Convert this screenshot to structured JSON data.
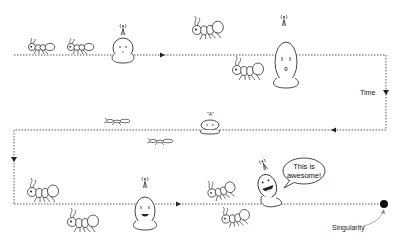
{
  "diagram": {
    "title": "",
    "labels": {
      "time": "Time",
      "singularity": "Singularity",
      "speech_line1": "This is",
      "speech_line2": "awesome!"
    },
    "colors": {
      "line": "#333333",
      "fill": "#ffffff",
      "dot": "#111111"
    },
    "rows": [
      {
        "name": "row-1",
        "direction": "right",
        "y": 55
      },
      {
        "name": "row-2",
        "direction": "left",
        "y": 130
      },
      {
        "name": "row-3",
        "direction": "right",
        "y": 204
      }
    ],
    "figures": [
      {
        "type": "ant",
        "row": 1,
        "x": 40,
        "y": 48
      },
      {
        "type": "ant",
        "row": 1,
        "x": 80,
        "y": 48
      },
      {
        "type": "robot-blob",
        "row": 1,
        "x": 124,
        "y": 50,
        "expression": "neutral"
      },
      {
        "type": "ant-upright",
        "row": 1,
        "x": 205,
        "y": 28
      },
      {
        "type": "ant-upright",
        "row": 1,
        "x": 245,
        "y": 70
      },
      {
        "type": "robot-tall",
        "row": 1,
        "x": 286,
        "y": 62,
        "expression": "surprised"
      },
      {
        "type": "ant-flat",
        "row": 2,
        "x": 126,
        "y": 121
      },
      {
        "type": "robot-flat",
        "row": 2,
        "x": 210,
        "y": 128
      },
      {
        "type": "ant-flat",
        "row": 2,
        "x": 168,
        "y": 141
      },
      {
        "type": "ant-upright",
        "row": 3,
        "x": 40,
        "y": 192
      },
      {
        "type": "ant-upright",
        "row": 3,
        "x": 80,
        "y": 222
      },
      {
        "type": "robot-happy",
        "row": 3,
        "x": 144,
        "y": 207,
        "expression": "smile"
      },
      {
        "type": "ant-lying",
        "row": 3,
        "x": 222,
        "y": 188
      },
      {
        "type": "ant-lying",
        "row": 3,
        "x": 236,
        "y": 217
      },
      {
        "type": "robot-happy-tilted",
        "row": 3,
        "x": 270,
        "y": 190,
        "expression": "laughing"
      }
    ]
  }
}
